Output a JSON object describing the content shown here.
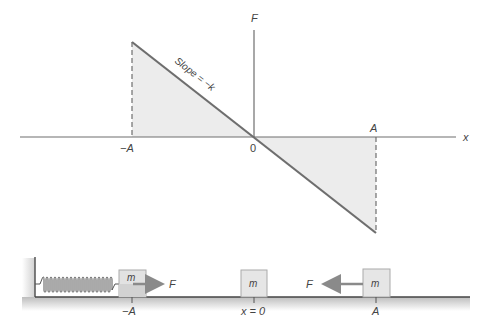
{
  "graph": {
    "y_axis_label": "F",
    "x_axis_label": "x",
    "origin_label": "0",
    "neg_amplitude_label": "−A",
    "pos_amplitude_label": "A",
    "slope_label": "Slope = −k"
  },
  "mechanism": {
    "mass_label": "m",
    "force_label_left": "F",
    "force_label_right": "F",
    "pos_neg_label": "−A",
    "pos_zero_label": "x = 0",
    "pos_pos_label": "A"
  },
  "colors": {
    "line": "#6e6e6e",
    "axis": "#6e6e6e",
    "fill": "#ececec",
    "block": "#e6e6e6",
    "arrow": "#8a8a8a"
  }
}
